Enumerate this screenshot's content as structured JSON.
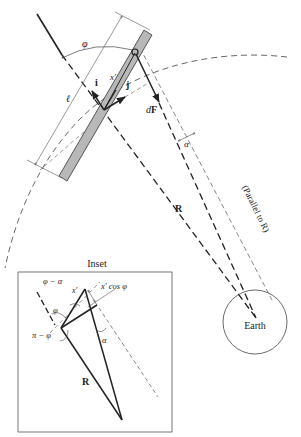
{
  "figure": {
    "type": "physics-diagram",
    "colors": {
      "ink": "#222222",
      "rod_fill": "#b8b8b8",
      "thin_line": "#555555",
      "background": "#ffffff"
    }
  },
  "main": {
    "labels": {
      "phi": "φ",
      "x_prime": "x′",
      "i_vec": "i",
      "j_vec": "j",
      "length": "ℓ",
      "dF_d": "d",
      "dF_F": "F",
      "alpha": "α",
      "R": "R",
      "parallel_note": "(Parallel to R)",
      "earth": "Earth"
    }
  },
  "inset": {
    "title": "Inset",
    "labels": {
      "phi_minus_alpha": "φ − α",
      "x_prime": "x′",
      "x_prime_cos_phi": "x′ cos φ",
      "phi": "φ",
      "pi_minus_phi": "π − φ",
      "alpha": "α",
      "R": "R"
    }
  }
}
